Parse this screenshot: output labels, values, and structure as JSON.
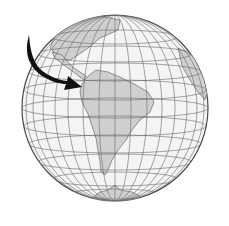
{
  "image": {
    "subject": "globe-south-america",
    "colors": {
      "background": "#ffffff",
      "ocean": "#f4f4f4",
      "land": "#cfcfcf",
      "grid": "#6a6a6a",
      "outline": "#4a4a4a",
      "arrow": "#111111"
    }
  }
}
